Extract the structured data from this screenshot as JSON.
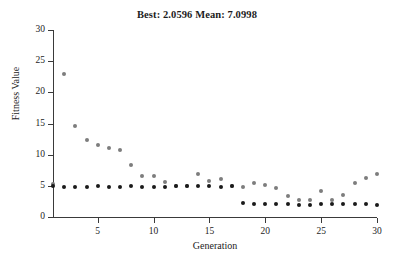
{
  "chart_data": {
    "type": "scatter",
    "title": "Best: 2.0596 Mean: 7.0998",
    "xlabel": "Generation",
    "ylabel": "Fitness Value",
    "xlim": [
      1,
      30
    ],
    "ylim": [
      0,
      30
    ],
    "xticks": [
      5,
      10,
      15,
      20,
      25,
      30
    ],
    "yticks": [
      0,
      5,
      10,
      15,
      20,
      25,
      30
    ],
    "grid": false,
    "legend_position": "none",
    "best_value": 2.0596,
    "mean_value": 7.0998,
    "colors": {
      "mean": "#7d7d7d",
      "best": "#1a1a1a",
      "axis": "#3a3a3a",
      "text": "#1c1c1c"
    },
    "x": [
      1,
      2,
      3,
      4,
      5,
      6,
      7,
      8,
      9,
      10,
      11,
      12,
      13,
      14,
      15,
      16,
      17,
      18,
      19,
      20,
      21,
      22,
      23,
      24,
      25,
      26,
      27,
      28,
      29,
      30
    ],
    "series": [
      {
        "name": "Mean fitness",
        "color": "#7d7d7d",
        "marker": "circle",
        "values": [
          5.3,
          23.0,
          14.6,
          12.3,
          11.6,
          11.1,
          10.7,
          8.4,
          6.5,
          6.5,
          5.6,
          5.0,
          4.9,
          6.9,
          5.8,
          6.1,
          4.9,
          4.8,
          5.5,
          5.2,
          4.7,
          3.4,
          2.8,
          2.7,
          4.2,
          2.8,
          3.6,
          5.4,
          6.2,
          6.9
        ]
      },
      {
        "name": "Best fitness",
        "color": "#1a1a1a",
        "marker": "circle",
        "values": [
          4.9,
          4.85,
          4.85,
          4.85,
          4.9,
          4.85,
          4.85,
          4.9,
          4.85,
          4.8,
          4.85,
          4.9,
          4.9,
          4.9,
          4.9,
          4.8,
          4.9,
          2.2,
          2.1,
          2.1,
          2.1,
          2.1,
          1.95,
          1.9,
          2.1,
          2.05,
          2.05,
          2.05,
          2.05,
          2.0
        ]
      }
    ]
  },
  "ytick_labels": [
    "0",
    "5",
    "10",
    "15",
    "20",
    "25",
    "30"
  ],
  "xtick_labels": [
    "5",
    "10",
    "15",
    "20",
    "25",
    "30"
  ]
}
